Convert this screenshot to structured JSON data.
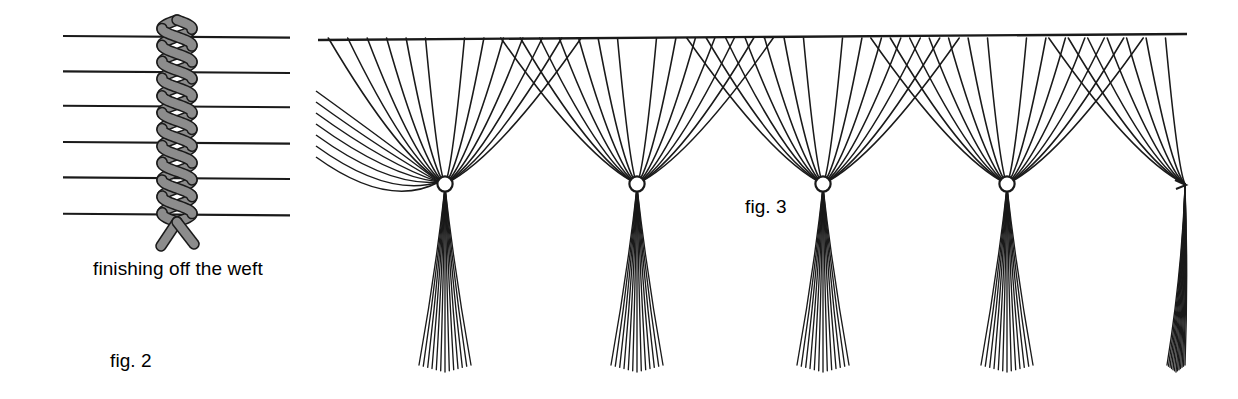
{
  "illustration": {
    "title": "Weaving technique diagrams: finishing off the weft and knotted fringe",
    "background_color": "#ffffff",
    "ink_color": "#1a1a1a",
    "cord_fill_color": "#8c8c8c",
    "width": 1238,
    "height": 399
  },
  "figures": [
    {
      "id": "fig2",
      "label": "fig. 2",
      "caption": "finishing off the weft",
      "description": "Vertical twisted two-ply cord woven across six horizontal warp threads, ends splayed below",
      "warp_line_count": 6,
      "twist_loop_count": 6,
      "warp_line_y": [
        36,
        71,
        105,
        141,
        176,
        212
      ],
      "warp_x_start": 63,
      "warp_x_end": 290,
      "cord_x": 177,
      "cord_top_y": 20,
      "cord_bottom_y": 246
    },
    {
      "id": "fig3",
      "label": "fig. 3",
      "caption": "",
      "description": "Scalloped knotted net: threads descend from a horizontal heading cord, cross in a diamond lattice and gather at knots, each finished with a hanging tassel",
      "heading_cord_y": 38,
      "heading_cord_x_start": 318,
      "heading_cord_x_end": 1187,
      "knot_y": 184,
      "knot_x": [
        445,
        637,
        823,
        1007,
        1185
      ],
      "knot_count": 5,
      "threads_per_side": 7,
      "tassel_thread_count": 13,
      "tassel_bottom_y": 372
    }
  ],
  "captions": {
    "weft": "finishing off the weft",
    "fig2": "fig. 2",
    "fig3": "fig. 3"
  }
}
